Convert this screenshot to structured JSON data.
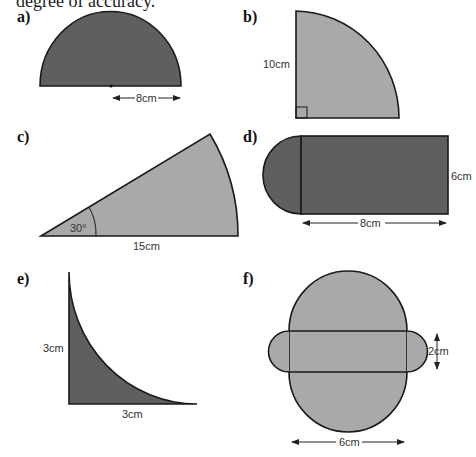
{
  "header": {
    "text": "degree of accuracy."
  },
  "colors": {
    "dark_fill": "#5f5f5f",
    "light_fill": "#a9a9a9",
    "stroke": "#1a1a1a"
  },
  "figures": [
    {
      "label": "a)",
      "shape": "semicircle",
      "fill": "dark",
      "dimensions": [
        "8cm"
      ]
    },
    {
      "label": "b)",
      "shape": "quarter-circle",
      "fill": "light",
      "dimensions": [
        "10cm"
      ]
    },
    {
      "label": "c)",
      "shape": "sector",
      "fill": "light",
      "dimensions": [
        "30°",
        "15cm"
      ]
    },
    {
      "label": "d)",
      "shape": "rectangle-with-semicircle",
      "fill": "dark",
      "dimensions": [
        "6cm",
        "8cm"
      ]
    },
    {
      "label": "e)",
      "shape": "square-minus-quarter-circle",
      "fill": "dark",
      "dimensions": [
        "3cm",
        "3cm"
      ]
    },
    {
      "label": "f)",
      "shape": "composite-circles-rectangle",
      "fill": "light",
      "dimensions": [
        "2cm",
        "6cm"
      ]
    }
  ]
}
